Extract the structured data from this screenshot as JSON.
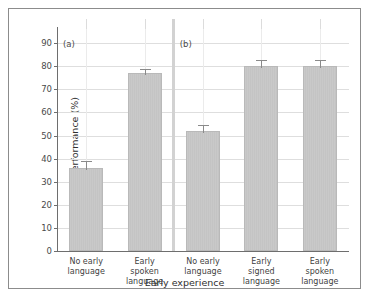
{
  "chart_data": {
    "type": "bar",
    "title": "",
    "xlabel": "Early experience",
    "ylabel": "Task performance (%)",
    "ylim": [
      0,
      97
    ],
    "yticks": [
      0,
      10,
      20,
      30,
      40,
      50,
      60,
      70,
      80,
      90
    ],
    "grid": true,
    "legend": false,
    "panels": [
      {
        "label": "(a)",
        "categories": [
          "No early language",
          "Early spoken language"
        ],
        "values": [
          36,
          77
        ],
        "errors": [
          3,
          2
        ]
      },
      {
        "label": "(b)",
        "categories": [
          "No early language",
          "Early signed language",
          "Early spoken language"
        ],
        "values": [
          52,
          80,
          80
        ],
        "errors": [
          2.5,
          2.5,
          2.5
        ]
      }
    ],
    "categories": [
      "No early language",
      "Early spoken language",
      "No early language",
      "Early signed language",
      "Early spoken language"
    ],
    "values": [
      36,
      77,
      52,
      80,
      80
    ],
    "errors": [
      3,
      2,
      2.5,
      2.5,
      2.5
    ],
    "bar_color": "#c9c9c9",
    "bar_edge_color": "#b9b9b9",
    "grid_color": "#dedede",
    "axis_color": "#6e6e6e"
  },
  "bars": [
    {
      "value": 36,
      "error": 3,
      "line1": "No early",
      "line2": "language",
      "line3": ""
    },
    {
      "value": 77,
      "error": 2,
      "line1": "Early",
      "line2": "spoken",
      "line3": "language"
    },
    {
      "value": 52,
      "error": 2.5,
      "line1": "No early",
      "line2": "language",
      "line3": ""
    },
    {
      "value": 80,
      "error": 2.5,
      "line1": "Early",
      "line2": "signed",
      "line3": "language"
    },
    {
      "value": 80,
      "error": 2.5,
      "line1": "Early",
      "line2": "spoken",
      "line3": "language"
    }
  ],
  "yticklabels": [
    "0",
    "10",
    "20",
    "30",
    "40",
    "50",
    "60",
    "70",
    "80",
    "90"
  ],
  "panel_labels": {
    "a": "(a)",
    "b": "(b)"
  },
  "axis_titles": {
    "y": "Task performance (%)",
    "x": "Early experience"
  }
}
